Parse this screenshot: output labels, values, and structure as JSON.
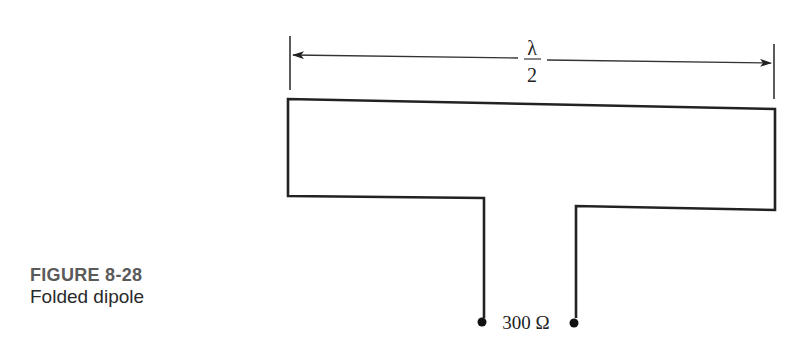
{
  "figure": {
    "number": "FIGURE 8-28",
    "title": "Folded dipole"
  },
  "diagram": {
    "dimension_numerator": "λ",
    "dimension_denominator": "2",
    "impedance_label": "300 Ω",
    "line_color": "#222222"
  }
}
